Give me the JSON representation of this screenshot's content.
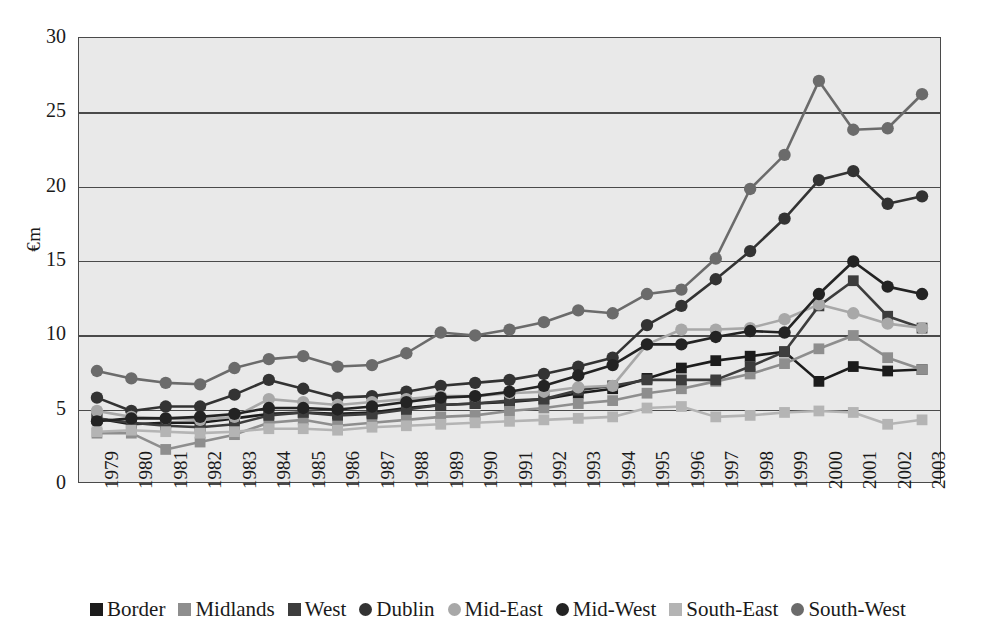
{
  "axes": {
    "ylabel": "€m",
    "yticks": [
      "30",
      "25",
      "20",
      "15",
      "10",
      "5",
      "0"
    ],
    "ylim": [
      0,
      30
    ],
    "xticks": [
      "1979",
      "1980",
      "1981",
      "1982",
      "1983",
      "1984",
      "1985",
      "1986",
      "1987",
      "1988",
      "1989",
      "1990",
      "1991",
      "1992",
      "1993",
      "1994",
      "1995",
      "1996",
      "1997",
      "1998",
      "1999",
      "2000",
      "2001",
      "2002",
      "2003"
    ]
  },
  "legend": {
    "items": [
      {
        "label": "Border",
        "marker": "square",
        "color": "#1c1c1c"
      },
      {
        "label": "Midlands",
        "marker": "square",
        "color": "#8e8e8e"
      },
      {
        "label": "West",
        "marker": "square",
        "color": "#3d3d3d"
      },
      {
        "label": "Dublin",
        "marker": "circle",
        "color": "#333333"
      },
      {
        "label": "Mid-East",
        "marker": "circle",
        "color": "#a8a8a8"
      },
      {
        "label": "Mid-West",
        "marker": "circle",
        "color": "#232323"
      },
      {
        "label": "South-East",
        "marker": "square",
        "color": "#b4b4b4"
      },
      {
        "label": "South-West",
        "marker": "circle",
        "color": "#6b6b6b"
      }
    ]
  },
  "chart_data": {
    "type": "line",
    "title": "",
    "xlabel": "",
    "ylabel": "€m",
    "ylim": [
      0,
      30
    ],
    "grid": true,
    "legend_position": "bottom",
    "x": [
      "1979",
      "1980",
      "1981",
      "1982",
      "1983",
      "1984",
      "1985",
      "1986",
      "1987",
      "1988",
      "1989",
      "1990",
      "1991",
      "1992",
      "1993",
      "1994",
      "1995",
      "1996",
      "1997",
      "1998",
      "1999",
      "2000",
      "2001",
      "2002",
      "2003"
    ],
    "series": [
      {
        "name": "Border",
        "color": "#1c1c1c",
        "marker": "square",
        "values": [
          4.3,
          3.9,
          4.0,
          4.0,
          4.3,
          4.6,
          4.7,
          4.6,
          4.7,
          5.0,
          5.2,
          5.3,
          5.4,
          5.6,
          6.0,
          6.3,
          7.0,
          7.7,
          8.2,
          8.5,
          8.8,
          6.8,
          7.8,
          7.5,
          7.6
        ]
      },
      {
        "name": "Midlands",
        "color": "#8e8e8e",
        "marker": "square",
        "values": [
          3.3,
          3.3,
          2.2,
          2.7,
          3.2,
          4.0,
          4.2,
          3.8,
          4.0,
          4.2,
          4.4,
          4.5,
          4.8,
          5.0,
          5.3,
          5.5,
          6.0,
          6.3,
          6.8,
          7.3,
          8.0,
          9.0,
          9.9,
          8.4,
          7.6
        ]
      },
      {
        "name": "West",
        "color": "#3d3d3d",
        "marker": "square",
        "values": [
          4.3,
          4.0,
          3.8,
          3.7,
          3.9,
          4.5,
          4.7,
          4.5,
          4.6,
          4.9,
          5.2,
          5.3,
          5.5,
          5.6,
          6.2,
          6.5,
          6.9,
          6.9,
          6.9,
          7.8,
          8.8,
          11.9,
          13.6,
          11.2,
          10.4
        ]
      },
      {
        "name": "Dublin",
        "color": "#333333",
        "marker": "circle",
        "values": [
          5.7,
          4.8,
          5.1,
          5.1,
          5.9,
          6.9,
          6.3,
          5.7,
          5.8,
          6.1,
          6.5,
          6.7,
          6.9,
          7.3,
          7.8,
          8.4,
          10.6,
          11.9,
          13.7,
          15.6,
          17.8,
          20.4,
          21.0,
          18.8,
          19.3
        ]
      },
      {
        "name": "Mid-East",
        "color": "#a8a8a8",
        "marker": "circle",
        "values": [
          4.8,
          4.4,
          4.3,
          4.2,
          4.4,
          5.6,
          5.4,
          5.2,
          5.4,
          5.6,
          5.8,
          5.8,
          6.0,
          6.1,
          6.4,
          6.5,
          9.3,
          10.3,
          10.3,
          10.4,
          11.0,
          12.0,
          11.4,
          10.7,
          10.4
        ]
      },
      {
        "name": "Mid-West",
        "color": "#232323",
        "marker": "circle",
        "values": [
          4.1,
          4.3,
          4.3,
          4.4,
          4.6,
          5.0,
          5.0,
          4.9,
          5.1,
          5.4,
          5.7,
          5.8,
          6.1,
          6.5,
          7.2,
          7.9,
          9.3,
          9.3,
          9.8,
          10.2,
          10.1,
          12.7,
          14.9,
          13.2,
          12.7
        ]
      },
      {
        "name": "South-East",
        "color": "#b4b4b4",
        "marker": "square",
        "values": [
          3.4,
          3.5,
          3.4,
          3.3,
          3.4,
          3.6,
          3.6,
          3.5,
          3.7,
          3.8,
          3.9,
          4.0,
          4.1,
          4.2,
          4.3,
          4.4,
          5.0,
          5.1,
          4.4,
          4.5,
          4.7,
          4.8,
          4.7,
          3.9,
          4.2
        ]
      },
      {
        "name": "South-West",
        "color": "#6b6b6b",
        "marker": "circle",
        "values": [
          7.5,
          7.0,
          6.7,
          6.6,
          7.7,
          8.3,
          8.5,
          7.8,
          7.9,
          8.7,
          10.1,
          9.9,
          10.3,
          10.8,
          11.6,
          11.4,
          12.7,
          13.0,
          15.1,
          19.8,
          22.1,
          27.1,
          23.8,
          23.9,
          26.2
        ]
      }
    ]
  }
}
